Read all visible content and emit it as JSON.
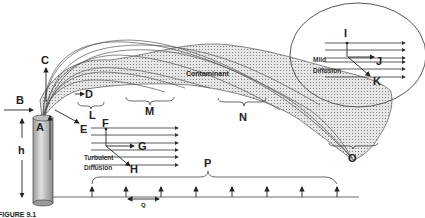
{
  "figure": {
    "caption": "FIGURE 9.1",
    "plume_label": "Contaminant",
    "labels": {
      "A": "A",
      "B": "B",
      "C": "C",
      "D": "D",
      "E": "E",
      "F": "F",
      "G": "G",
      "H": "H",
      "I": "I",
      "J": "J",
      "K": "K",
      "L": "L",
      "M": "M",
      "N": "N",
      "O": "O",
      "P": "P",
      "Q": "Q",
      "h": "h"
    },
    "turbulent_diffusion": {
      "line1": "Turbulent",
      "line2": "Diffusion"
    },
    "mild_diffusion": {
      "line1": "Mild",
      "line2": "Diffusion"
    }
  },
  "colors": {
    "stroke": "#333333",
    "plume_fill": "#d9d9d9",
    "stack_fill": "#cfcfcf",
    "background": "#ffffff"
  }
}
